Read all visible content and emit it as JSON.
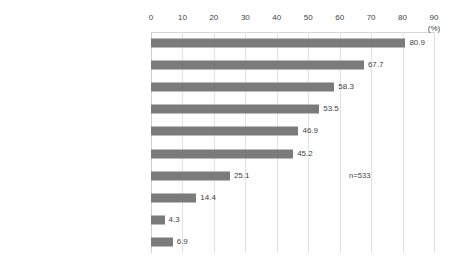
{
  "chart_data": {
    "type": "bar",
    "orientation": "horizontal",
    "title": "",
    "subtitle": "",
    "xlabel": "(%)",
    "ylabel": "",
    "xlim": [
      0,
      90
    ],
    "xticks": [
      0,
      10,
      20,
      30,
      40,
      50,
      60,
      70,
      80,
      90
    ],
    "xtick_labels": [
      "0",
      "10",
      "20",
      "30",
      "40",
      "50",
      "60",
      "70",
      "80",
      "90"
    ],
    "grid": true,
    "legend": false,
    "legend_position": "none",
    "bar_color": "#7b7b7b",
    "gridline_color": "#e2e2e2",
    "categories": [
      "Top Message, Corporate Vision",
      "Products / Services PR",
      "Internal activation",
      "Management and business strategies",
      "Risk management",
      "CSR",
      "Finance",
      "Recruiting",
      "Outreach to policy and regulations",
      "Other"
    ],
    "values": [
      80.9,
      67.7,
      58.3,
      53.5,
      46.9,
      45.2,
      25.1,
      14.4,
      4.3,
      6.9
    ],
    "value_labels": [
      "80.9",
      "67.7",
      "58.3",
      "53.5",
      "46.9",
      "45.2",
      "25.1",
      "14.4",
      "4.3",
      "6.9"
    ],
    "annotations": [
      {
        "text": "n=533",
        "x": 63,
        "y_index": 6
      }
    ]
  },
  "axis": {
    "unit_label": "(%)"
  },
  "note": {
    "sample_size": "n=533"
  }
}
